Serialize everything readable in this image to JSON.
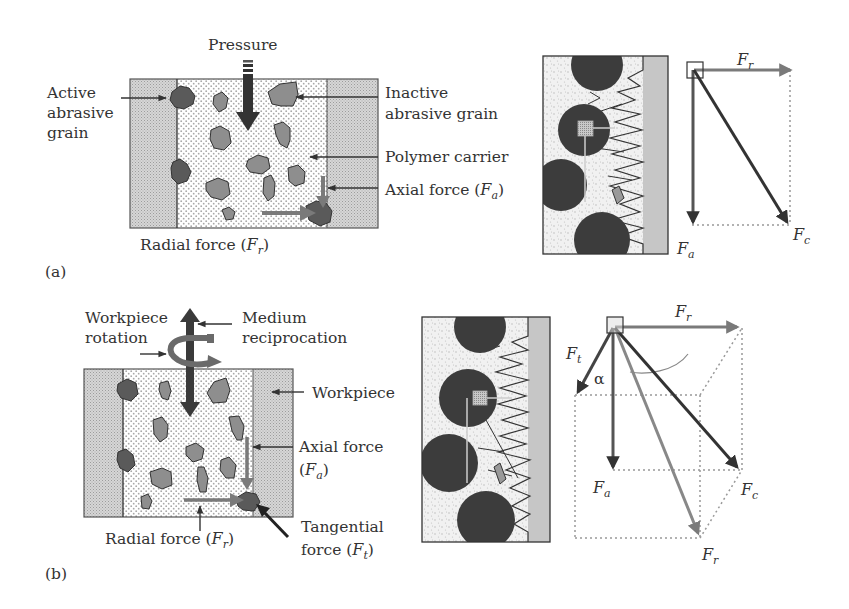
{
  "colors": {
    "ink": "#333333",
    "hatch": "#c8c8c8",
    "active_grain": "#5a5a5a",
    "inactive_grain": "#8e8e8e",
    "force_gray": "#7a7a7a",
    "force_dark": "#3a3a3a",
    "dotted": "#9a9a9a",
    "workpiece_strip": "#c6c6c6",
    "micro_particle": "#3c3c3c"
  },
  "panel_a": {
    "label": "(a)",
    "labels": {
      "pressure": "Pressure",
      "active_line1": "Active",
      "active_line2": "abrasive",
      "active_line3": "grain",
      "inactive_line1": "Inactive",
      "inactive_line2": "abrasive grain",
      "polymer": "Polymer carrier",
      "axial_prefix": "Axial force (",
      "axial_sym": "F",
      "axial_sub": "a",
      "axial_suffix": ")",
      "radial_prefix": "Radial force (",
      "radial_sym": "F",
      "radial_sub": "r",
      "radial_suffix": ")"
    },
    "vector_diagram": {
      "fr_sym": "F",
      "fr_sub": "r",
      "fa_sym": "F",
      "fa_sub": "a",
      "fc_sym": "F",
      "fc_sub": "c"
    }
  },
  "panel_b": {
    "label": "(b)",
    "labels": {
      "rotation_line1": "Workpiece",
      "rotation_line2": "rotation",
      "recip_line1": "Medium",
      "recip_line2": "reciprocation",
      "workpiece": "Workpiece",
      "axial_line1": "Axial force",
      "axial_prefix": "(",
      "axial_sym": "F",
      "axial_sub": "a",
      "axial_suffix": ")",
      "radial_prefix": "Radial force (",
      "radial_sym": "F",
      "radial_sub": "r",
      "radial_suffix": ")",
      "tangential_line1": "Tangential",
      "tangential_prefix": "force (",
      "tangential_sym": "F",
      "tangential_sub": "t",
      "tangential_suffix": ")"
    },
    "vector_diagram": {
      "fr_top_sym": "F",
      "fr_top_sub": "r",
      "ft_sym": "F",
      "ft_sub": "t",
      "alpha": "α",
      "fa_sym": "F",
      "fa_sub": "a",
      "fc_sym": "F",
      "fc_sub": "c",
      "fr_bottom_sym": "F",
      "fr_bottom_sub": "r"
    }
  }
}
